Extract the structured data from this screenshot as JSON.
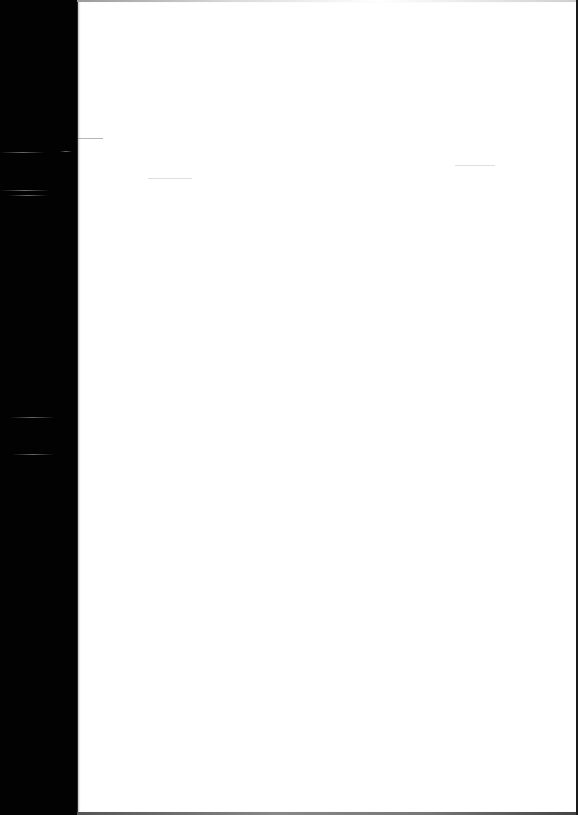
{
  "document": {
    "type": "scanned-page",
    "content": "",
    "page_state": "blank"
  },
  "colors": {
    "background": "#000000",
    "paper": "#ffffff"
  }
}
